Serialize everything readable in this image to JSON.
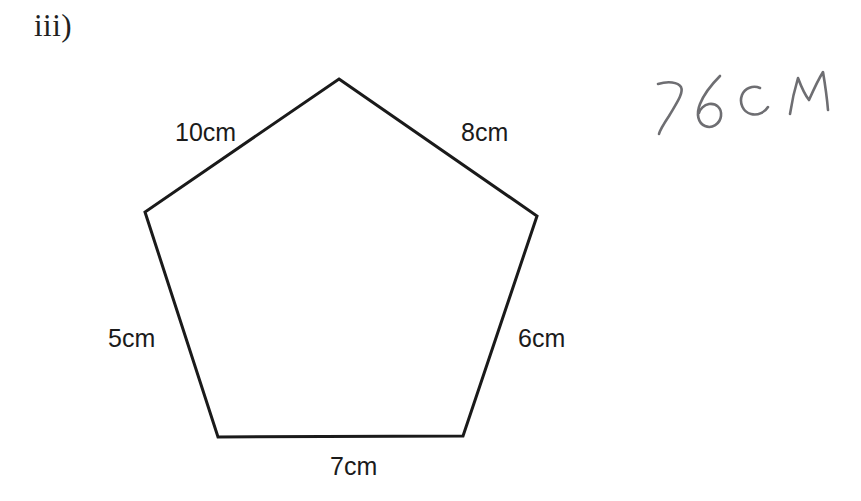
{
  "question": {
    "item_label": "iii)"
  },
  "figure": {
    "shape_name": "irregular-pentagon",
    "stroke_color": "#1a1a1a",
    "fill_color": "#ffffff",
    "stroke_width": 3,
    "vertices": [
      {
        "name": "apex",
        "x": 339,
        "y": 79
      },
      {
        "name": "right-upper",
        "x": 537,
        "y": 216
      },
      {
        "name": "right-lower",
        "x": 463,
        "y": 436
      },
      {
        "name": "left-lower",
        "x": 218,
        "y": 437
      },
      {
        "name": "left-upper",
        "x": 145,
        "y": 212
      }
    ],
    "side_labels": [
      {
        "name": "top-left-side",
        "text": "10cm",
        "value": 10,
        "unit": "cm"
      },
      {
        "name": "top-right-side",
        "text": "8cm",
        "value": 8,
        "unit": "cm"
      },
      {
        "name": "left-side",
        "text": "5cm",
        "value": 5,
        "unit": "cm"
      },
      {
        "name": "right-side",
        "text": "6cm",
        "value": 6,
        "unit": "cm"
      },
      {
        "name": "bottom-side",
        "text": "7cm",
        "value": 7,
        "unit": "cm"
      }
    ]
  },
  "annotation": {
    "handwritten_answer": "36cM",
    "ink_color": "#6e6e72"
  }
}
